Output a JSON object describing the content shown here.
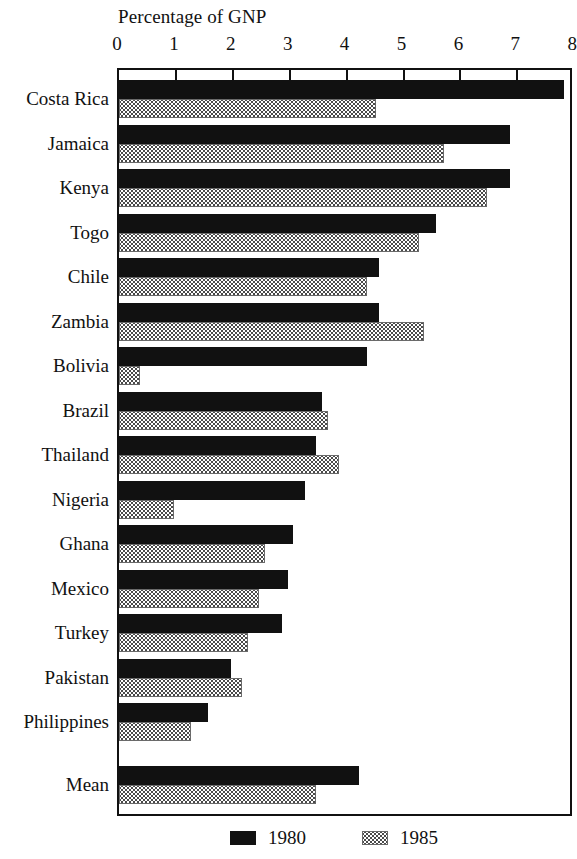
{
  "chart_data": {
    "type": "bar",
    "orientation": "horizontal",
    "title": "Percentage of GNP",
    "xlabel": "Percentage of GNP",
    "ylabel": "",
    "xlim": [
      0,
      8
    ],
    "xticks": [
      0,
      1,
      2,
      3,
      4,
      5,
      6,
      7,
      8
    ],
    "xtick_labels": [
      "0",
      "1",
      "2",
      "3",
      "4",
      "5",
      "6",
      "7",
      "8"
    ],
    "grid": false,
    "legend_position": "bottom",
    "categories": [
      "Costa Rica",
      "Jamaica",
      "Kenya",
      "Togo",
      "Chile",
      "Zambia",
      "Bolivia",
      "Brazil",
      "Thailand",
      "Nigeria",
      "Ghana",
      "Mexico",
      "Turkey",
      "Pakistan",
      "Philippines",
      "Mean"
    ],
    "series": [
      {
        "name": "1980",
        "color": "#111111",
        "values": [
          7.85,
          6.9,
          6.9,
          5.6,
          4.6,
          4.6,
          4.4,
          3.6,
          3.5,
          3.3,
          3.1,
          3.0,
          2.9,
          2.0,
          1.6,
          4.25
        ]
      },
      {
        "name": "1985",
        "color": "#9a9a9a",
        "values": [
          4.55,
          5.75,
          6.5,
          5.3,
          4.4,
          5.4,
          0.4,
          3.7,
          3.9,
          1.0,
          2.6,
          2.5,
          2.3,
          2.2,
          1.3,
          3.5
        ]
      }
    ],
    "legend": [
      {
        "label": "1980",
        "swatch": "dark-solid"
      },
      {
        "label": "1985",
        "swatch": "light-checkered"
      }
    ]
  }
}
